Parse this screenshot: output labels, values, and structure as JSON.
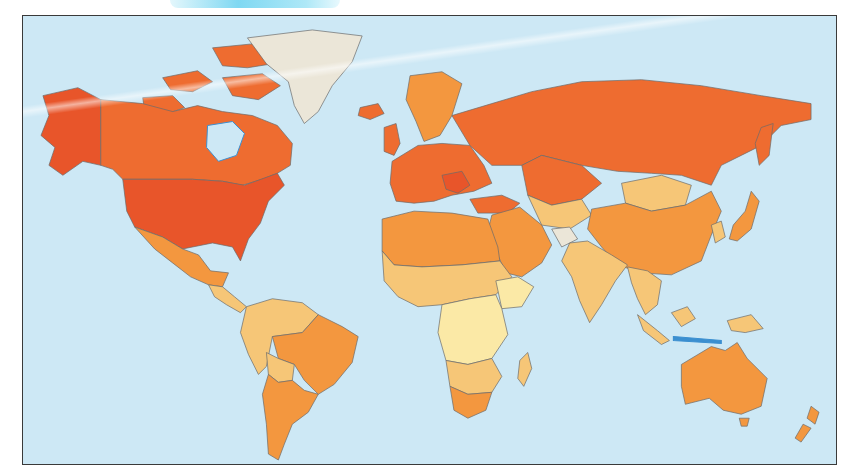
{
  "map": {
    "type": "choropleth-world-map",
    "projection": "equirectangular-like",
    "ocean_color": "#cde8f5",
    "frame_color": "#3a3a3a",
    "legend": null,
    "title": null,
    "tiers": [
      {
        "id": "tier1",
        "color": "#e8552a",
        "description": "darkest red-orange"
      },
      {
        "id": "tier2",
        "color": "#ee6c30",
        "description": "red-orange"
      },
      {
        "id": "tier3",
        "color": "#f3973f",
        "description": "orange"
      },
      {
        "id": "tier4",
        "color": "#f6c677",
        "description": "light orange"
      },
      {
        "id": "tier5",
        "color": "#fbe9a6",
        "description": "pale yellow"
      },
      {
        "id": "nodata",
        "color": "#ebe6d8",
        "description": "grey / no data"
      }
    ],
    "regions": [
      {
        "name": "Alaska",
        "tier": "tier1"
      },
      {
        "name": "United States",
        "tier": "tier1"
      },
      {
        "name": "Canada",
        "tier": "tier2"
      },
      {
        "name": "Greenland",
        "tier": "nodata"
      },
      {
        "name": "Iceland",
        "tier": "tier2"
      },
      {
        "name": "Mexico",
        "tier": "tier3"
      },
      {
        "name": "Central America",
        "tier": "tier4"
      },
      {
        "name": "Northern South America",
        "tier": "tier4"
      },
      {
        "name": "Brazil",
        "tier": "tier3"
      },
      {
        "name": "Bolivia",
        "tier": "tier4"
      },
      {
        "name": "Argentina / Chile",
        "tier": "tier3"
      },
      {
        "name": "Scandinavia",
        "tier": "tier3"
      },
      {
        "name": "Western Europe",
        "tier": "tier2"
      },
      {
        "name": "Russia",
        "tier": "tier2"
      },
      {
        "name": "Kazakhstan",
        "tier": "tier2"
      },
      {
        "name": "Mongolia",
        "tier": "tier4"
      },
      {
        "name": "China",
        "tier": "tier3"
      },
      {
        "name": "Japan",
        "tier": "tier3"
      },
      {
        "name": "Middle East",
        "tier": "tier3"
      },
      {
        "name": "Afghanistan",
        "tier": "nodata"
      },
      {
        "name": "India",
        "tier": "tier4"
      },
      {
        "name": "Southeast Asia",
        "tier": "tier4"
      },
      {
        "name": "North Africa",
        "tier": "tier3"
      },
      {
        "name": "Sahel / West Africa",
        "tier": "tier4"
      },
      {
        "name": "Central & East Africa",
        "tier": "tier5"
      },
      {
        "name": "Southern Africa",
        "tier": "tier4"
      },
      {
        "name": "South Africa",
        "tier": "tier3"
      },
      {
        "name": "Madagascar",
        "tier": "tier4"
      },
      {
        "name": "Indonesia",
        "tier": "tier4"
      },
      {
        "name": "Australia",
        "tier": "tier3"
      },
      {
        "name": "New Zealand",
        "tier": "tier3"
      }
    ]
  }
}
